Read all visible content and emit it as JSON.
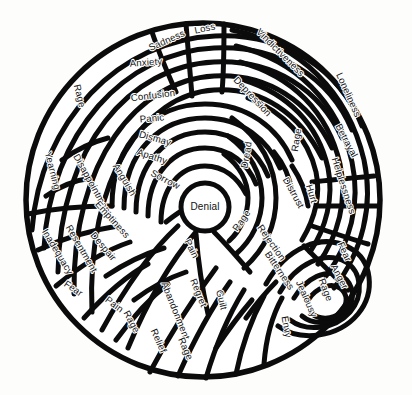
{
  "page": {
    "background_color": "#fdfdfc",
    "ink_color": "#0b0b0b",
    "scan_rule_color": "#6e6e6e",
    "faint_rule_color": "#dcdcda"
  },
  "diagram": {
    "type": "concentric-maze-wheel",
    "center_label": "Denial",
    "center": {
      "x": 205,
      "y": 207,
      "radius": 23
    },
    "outer_circle": {
      "cx": 203,
      "cy": 200,
      "rx": 178,
      "ry": 178
    },
    "label_count": 38
  },
  "labels": [
    {
      "id": "loss",
      "text": "Loss",
      "x": 205,
      "y": 29,
      "rot": -12,
      "size": "big"
    },
    {
      "id": "sadness",
      "text": "Sadness",
      "x": 167,
      "y": 41,
      "rot": -24,
      "size": "big"
    },
    {
      "id": "anxiety",
      "text": "Anxiety",
      "x": 146,
      "y": 63,
      "rot": -4,
      "size": "big"
    },
    {
      "id": "confusion",
      "text": "Confusion",
      "x": 153,
      "y": 96,
      "rot": -7,
      "size": "big"
    },
    {
      "id": "panic",
      "text": "Panic",
      "x": 152,
      "y": 119,
      "rot": -5,
      "size": "big"
    },
    {
      "id": "dismay",
      "text": "Dismay",
      "x": 155,
      "y": 139,
      "rot": 16,
      "size": "big"
    },
    {
      "id": "apathy",
      "text": "Apathy",
      "x": 152,
      "y": 157,
      "rot": 18,
      "size": "big"
    },
    {
      "id": "sorrow",
      "text": "Sorrow",
      "x": 165,
      "y": 180,
      "rot": 27,
      "size": "big"
    },
    {
      "id": "vindictiveness",
      "text": "Vindictiveness",
      "x": 280,
      "y": 53,
      "rot": 45,
      "size": "big"
    },
    {
      "id": "depression",
      "text": "Depression",
      "x": 252,
      "y": 97,
      "rot": 47,
      "size": "big"
    },
    {
      "id": "loneliness",
      "text": "Loneliness",
      "x": 348,
      "y": 95,
      "rot": 66,
      "size": "big"
    },
    {
      "id": "rage-top-right",
      "text": "Rage",
      "x": 297,
      "y": 140,
      "rot": -81,
      "size": "big"
    },
    {
      "id": "dread",
      "text": "Dread",
      "x": 247,
      "y": 155,
      "rot": -80,
      "size": "big"
    },
    {
      "id": "betrayal",
      "text": "Betrayal",
      "x": 346,
      "y": 141,
      "rot": 62,
      "size": "big"
    },
    {
      "id": "helplessness",
      "text": "Helplessness",
      "x": 343,
      "y": 186,
      "rot": 72,
      "size": "big"
    },
    {
      "id": "distrust",
      "text": "Distrust",
      "x": 293,
      "y": 193,
      "rot": 61,
      "size": "big"
    },
    {
      "id": "hurt",
      "text": "Hurt",
      "x": 311,
      "y": 194,
      "rot": 72,
      "size": "big"
    },
    {
      "id": "rage-mid-right",
      "text": "Rage",
      "x": 242,
      "y": 221,
      "rot": -55,
      "size": "big"
    },
    {
      "id": "rejection",
      "text": "Rejection",
      "x": 271,
      "y": 243,
      "rot": 55,
      "size": "big"
    },
    {
      "id": "bitterness",
      "text": "Bitterness",
      "x": 279,
      "y": 271,
      "rot": 56,
      "size": "big"
    },
    {
      "id": "fear-right",
      "text": "Fear",
      "x": 344,
      "y": 252,
      "rot": 66,
      "size": "big"
    },
    {
      "id": "anger",
      "text": "Anger",
      "x": 339,
      "y": 277,
      "rot": 62,
      "size": "big"
    },
    {
      "id": "rage-lower-right",
      "text": "Rage",
      "x": 325,
      "y": 290,
      "rot": 69,
      "size": "big"
    },
    {
      "id": "jealousy",
      "text": "Jealousy",
      "x": 306,
      "y": 299,
      "rot": 66,
      "size": "big"
    },
    {
      "id": "envy",
      "text": "Envy",
      "x": 286,
      "y": 327,
      "rot": 80,
      "size": "big"
    },
    {
      "id": "guilt",
      "text": "Guilt",
      "x": 221,
      "y": 300,
      "rot": 76,
      "size": "big"
    },
    {
      "id": "regret",
      "text": "Regret",
      "x": 198,
      "y": 293,
      "rot": 68,
      "size": "big"
    },
    {
      "id": "pain-center",
      "text": "Pain",
      "x": 191,
      "y": 249,
      "rot": 63,
      "size": "big"
    },
    {
      "id": "abandonment",
      "text": "Abandonment",
      "x": 175,
      "y": 311,
      "rot": 68,
      "size": "big"
    },
    {
      "id": "relief",
      "text": "Relief",
      "x": 158,
      "y": 341,
      "rot": 66,
      "size": "big"
    },
    {
      "id": "rage-bottom",
      "text": "Rage",
      "x": 185,
      "y": 349,
      "rot": 66,
      "size": "big"
    },
    {
      "id": "rage-bottom-left",
      "text": "Rage",
      "x": 131,
      "y": 322,
      "rot": 62,
      "size": "big"
    },
    {
      "id": "pain-left",
      "text": "Pain",
      "x": 114,
      "y": 305,
      "rot": 37,
      "size": "big"
    },
    {
      "id": "fear-left",
      "text": "Fear",
      "x": 73,
      "y": 289,
      "rot": 34,
      "size": "big"
    },
    {
      "id": "inadequacy",
      "text": "Inadequacy",
      "x": 57,
      "y": 252,
      "rot": 59,
      "size": "big"
    },
    {
      "id": "resentment",
      "text": "Resentment",
      "x": 81,
      "y": 249,
      "rot": 60,
      "size": "big"
    },
    {
      "id": "yearning",
      "text": "Yearning",
      "x": 52,
      "y": 171,
      "rot": 76,
      "size": "big"
    },
    {
      "id": "disappointment",
      "text": "Disappointment",
      "x": 92,
      "y": 185,
      "rot": 61,
      "size": "big"
    },
    {
      "id": "anguish",
      "text": "Anguish",
      "x": 124,
      "y": 180,
      "rot": 59,
      "size": "big"
    },
    {
      "id": "emptiness",
      "text": "Emptiness",
      "x": 112,
      "y": 220,
      "rot": 48,
      "size": "big"
    },
    {
      "id": "despair",
      "text": "Despair",
      "x": 103,
      "y": 247,
      "rot": 50,
      "size": "big"
    },
    {
      "id": "rage-upper-left",
      "text": "Rage",
      "x": 79,
      "y": 96,
      "rot": 76,
      "size": "big"
    },
    {
      "id": "denial",
      "text": "Denial",
      "x": 205,
      "y": 207,
      "rot": 0,
      "size": "center"
    }
  ]
}
